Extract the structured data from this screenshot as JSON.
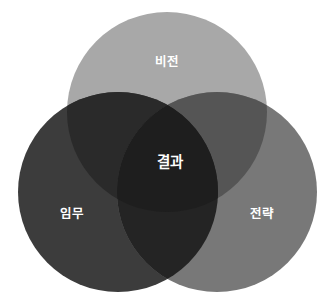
{
  "diagram": {
    "type": "venn-3-circle",
    "background_color": "#ffffff",
    "width": 333,
    "height": 302,
    "label_color": "#ffffff",
    "circles": [
      {
        "id": "vision",
        "label": "비전",
        "color": "#a8a8a8",
        "cx": 167,
        "cy": 112,
        "r": 100,
        "label_x": 167,
        "label_y": 62
      },
      {
        "id": "mission",
        "label": "임무",
        "color": "#3c3c3c",
        "cx": 118,
        "cy": 192,
        "r": 100,
        "label_x": 72,
        "label_y": 214
      },
      {
        "id": "strategy",
        "label": "전략",
        "color": "#787878",
        "cx": 217,
        "cy": 192,
        "r": 100,
        "label_x": 262,
        "label_y": 214
      }
    ],
    "intersections": {
      "vision_mission": "#2a2a2a",
      "vision_strategy": "#555555",
      "mission_strategy": "#242424",
      "center": {
        "label": "결과",
        "color": "#1e1e1e",
        "label_x": 170,
        "label_y": 162
      }
    }
  }
}
